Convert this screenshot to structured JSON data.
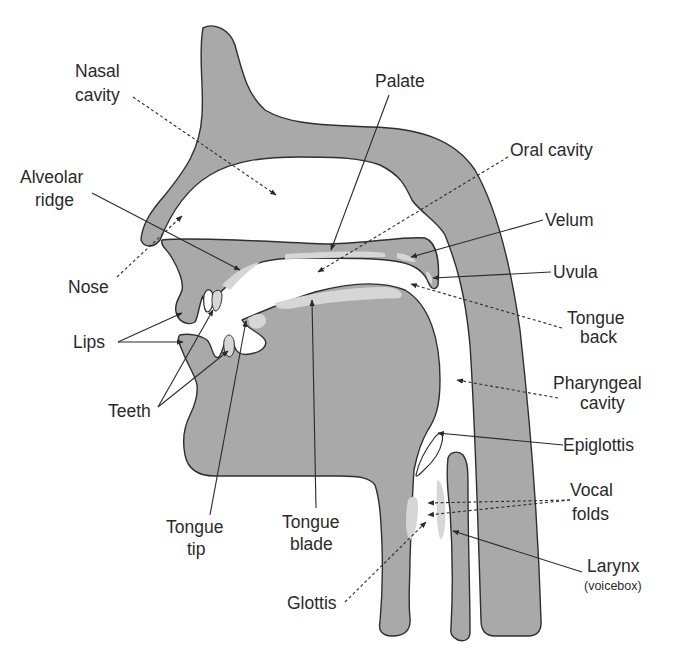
{
  "diagram": {
    "colors": {
      "tissue": "#a9a9a9",
      "outline": "#2f2f2f",
      "highlight": "#d6d6d6",
      "text": "#2a2a2a",
      "background": "#ffffff"
    },
    "labels": {
      "nasal_cavity": {
        "line1": "Nasal",
        "line2": "cavity",
        "leader": "dashed"
      },
      "palate": {
        "line1": "Palate",
        "leader": "solid"
      },
      "oral_cavity": {
        "line1": "Oral cavity",
        "leader": "dashed"
      },
      "alveolar_ridge": {
        "line1": "Alveolar",
        "line2": "ridge",
        "leader": "solid"
      },
      "velum": {
        "line1": "Velum",
        "leader": "solid"
      },
      "uvula": {
        "line1": "Uvula",
        "leader": "solid"
      },
      "nose": {
        "line1": "Nose",
        "leader": "dashed"
      },
      "tongue_back": {
        "line1": "Tongue",
        "line2": "back",
        "leader": "dashed"
      },
      "lips": {
        "line1": "Lips",
        "leader": "solid"
      },
      "pharyngeal_cavity": {
        "line1": "Pharyngeal",
        "line2": "cavity",
        "leader": "dashed"
      },
      "teeth": {
        "line1": "Teeth",
        "leader": "solid"
      },
      "epiglottis": {
        "line1": "Epiglottis",
        "leader": "solid"
      },
      "vocal_folds": {
        "line1": "Vocal",
        "line2": "folds",
        "leader": "dashed"
      },
      "tongue_tip": {
        "line1": "Tongue",
        "line2": "tip",
        "leader": "solid"
      },
      "tongue_blade": {
        "line1": "Tongue",
        "line2": "blade",
        "leader": "solid"
      },
      "larynx": {
        "line1": "Larynx",
        "line2": "(voicebox)",
        "leader": "solid"
      },
      "glottis": {
        "line1": "Glottis",
        "leader": "dashed"
      }
    }
  }
}
